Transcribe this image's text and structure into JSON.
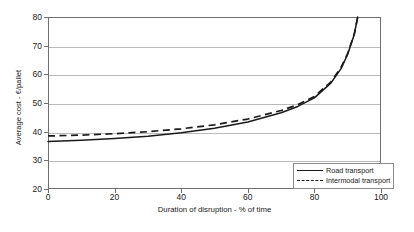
{
  "chart_data": {
    "type": "line",
    "title": "",
    "xlabel": "Duration of disruption - % of time",
    "ylabel": "Average cost - €/pallet",
    "xlim": [
      0,
      100
    ],
    "ylim": [
      20,
      80
    ],
    "xticks": [
      0,
      20,
      40,
      60,
      80,
      100
    ],
    "yticks": [
      20,
      30,
      40,
      50,
      60,
      70,
      80
    ],
    "grid": "horizontal",
    "legend_position": "bottom-right",
    "x": [
      0,
      10,
      20,
      30,
      40,
      50,
      60,
      70,
      75,
      80,
      85,
      88,
      90,
      92,
      93
    ],
    "series": [
      {
        "name": "Road transport",
        "style": "solid",
        "color": "#1a1a1a",
        "values": [
          36.6,
          37.0,
          37.6,
          38.4,
          39.6,
          41.2,
          43.4,
          46.6,
          48.8,
          51.8,
          57.0,
          62.0,
          67.0,
          74.0,
          80.0
        ]
      },
      {
        "name": "Intermodal transport",
        "style": "dashed",
        "color": "#1a1a1a",
        "values": [
          38.5,
          38.8,
          39.3,
          40.0,
          41.0,
          42.4,
          44.4,
          47.4,
          49.4,
          52.3,
          57.4,
          62.4,
          67.3,
          74.2,
          80.0
        ]
      }
    ]
  },
  "legend": {
    "items": [
      {
        "label": "Road transport"
      },
      {
        "label": "Intermodal transport"
      }
    ]
  }
}
